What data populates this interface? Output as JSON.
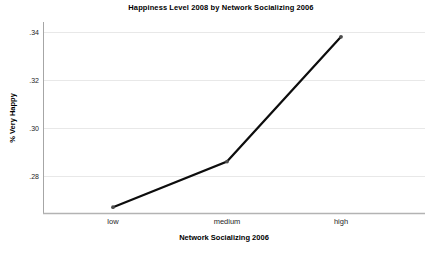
{
  "chart_data": {
    "type": "line",
    "title": "Happiness Level 2008 by Network Socializing 2006",
    "xlabel": "Network Socializing 2006",
    "ylabel": "% Very Happy",
    "categories": [
      "low",
      "medium",
      "high"
    ],
    "series": [
      {
        "name": "% Very Happy",
        "values": [
          0.267,
          0.286,
          0.338
        ]
      }
    ],
    "ytick_values": [
      0.28,
      0.3,
      0.32,
      0.34
    ],
    "ytick_labels": [
      ".28",
      ".30",
      ".32",
      ".34"
    ],
    "ylim": [
      0.2645,
      0.3442
    ],
    "grid": "horizontal-only",
    "legend": "none",
    "colors": {
      "line": "#0d0d0d",
      "marker": "#4d4d4d",
      "grid": "#e8e8e8",
      "y_axis": "#a6a6a6",
      "x_axis": "#b3b3b3",
      "text": "#000000",
      "background": "#ffffff"
    }
  }
}
